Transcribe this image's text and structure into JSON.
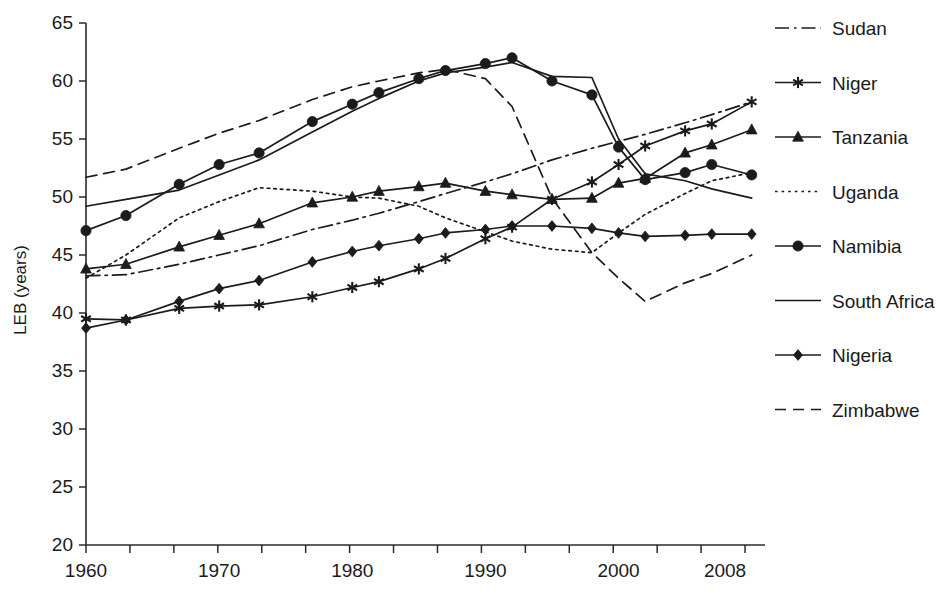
{
  "chart_data": {
    "type": "line",
    "title": "",
    "xlabel": "",
    "ylabel": "LEB (years)",
    "xlim": [
      1960,
      2011
    ],
    "ylim": [
      20,
      65
    ],
    "grid": false,
    "legend_position": "right",
    "x_tick_labels": [
      "1960",
      "1970",
      "1980",
      "1990",
      "2000",
      "2008"
    ],
    "x_tick_values": [
      1960,
      1970,
      1980,
      1990,
      2000,
      2008
    ],
    "x_minor_tick_step": 3.3,
    "y_tick_labels": [
      "20",
      "25",
      "30",
      "35",
      "40",
      "45",
      "50",
      "55",
      "60",
      "65"
    ],
    "y_tick_values": [
      20,
      25,
      30,
      35,
      40,
      45,
      50,
      55,
      60,
      65
    ],
    "x": [
      1960,
      1963,
      1967,
      1970,
      1973,
      1977,
      1980,
      1982,
      1985,
      1987,
      1990,
      1992,
      1995,
      1998,
      2000,
      2002,
      2005,
      2007,
      2010
    ],
    "series": [
      {
        "name": "Sudan",
        "style": "dashdot",
        "marker": "none",
        "values": [
          43.2,
          43.3,
          44.2,
          45.0,
          45.8,
          47.2,
          48.0,
          48.6,
          49.6,
          50.3,
          51.3,
          52.0,
          53.2,
          54.2,
          54.8,
          55.4,
          56.4,
          57.1,
          58.2
        ]
      },
      {
        "name": "Niger",
        "style": "solid",
        "marker": "star",
        "values": [
          39.5,
          39.4,
          40.4,
          40.6,
          40.7,
          41.4,
          42.2,
          42.7,
          43.8,
          44.7,
          46.4,
          47.4,
          49.8,
          51.3,
          52.8,
          54.4,
          55.7,
          56.3,
          58.2
        ]
      },
      {
        "name": "Tanzania",
        "style": "solid",
        "marker": "triangle",
        "values": [
          43.8,
          44.2,
          45.7,
          46.7,
          47.7,
          49.5,
          50.0,
          50.5,
          50.9,
          51.2,
          50.5,
          50.2,
          49.8,
          49.9,
          51.2,
          51.6,
          53.8,
          54.5,
          55.8
        ]
      },
      {
        "name": "Uganda",
        "style": "dotted",
        "marker": "none",
        "values": [
          43.0,
          45.0,
          48.2,
          49.6,
          50.8,
          50.5,
          50.0,
          49.9,
          49.2,
          48.2,
          47.0,
          46.2,
          45.5,
          45.2,
          46.9,
          48.5,
          50.3,
          51.4,
          52.1
        ]
      },
      {
        "name": "Namibia",
        "style": "solid",
        "marker": "circle",
        "values": [
          47.1,
          48.4,
          51.1,
          52.8,
          53.8,
          56.5,
          58.0,
          59.0,
          60.2,
          60.9,
          61.5,
          62.0,
          60.0,
          58.8,
          54.3,
          51.5,
          52.1,
          52.8,
          51.9
        ]
      },
      {
        "name": "South Africa",
        "style": "solid",
        "marker": "none",
        "values": [
          49.2,
          49.8,
          50.6,
          51.9,
          53.2,
          55.6,
          57.4,
          58.5,
          60.0,
          60.7,
          61.2,
          61.6,
          60.4,
          60.3,
          55.0,
          52.0,
          51.4,
          50.7,
          49.9
        ]
      },
      {
        "name": "Nigeria",
        "style": "solid",
        "marker": "diamond",
        "values": [
          38.7,
          39.4,
          41.0,
          42.1,
          42.8,
          44.4,
          45.3,
          45.8,
          46.4,
          46.9,
          47.2,
          47.5,
          47.5,
          47.3,
          46.9,
          46.6,
          46.7,
          46.8,
          46.8
        ]
      },
      {
        "name": "Zimbabwe",
        "style": "dashed",
        "marker": "none",
        "values": [
          51.7,
          52.4,
          54.2,
          55.5,
          56.6,
          58.4,
          59.5,
          60.0,
          60.7,
          61.0,
          60.2,
          57.8,
          49.9,
          45.2,
          43.0,
          41.0,
          42.6,
          43.4,
          45.0
        ]
      }
    ]
  },
  "legend": {
    "items": [
      {
        "label": "Sudan"
      },
      {
        "label": "Niger"
      },
      {
        "label": "Tanzania"
      },
      {
        "label": "Uganda"
      },
      {
        "label": "Namibia"
      },
      {
        "label": "South Africa"
      },
      {
        "label": "Nigeria"
      },
      {
        "label": "Zimbabwe"
      }
    ]
  },
  "colors": {
    "ink": "#1b1b1b",
    "axis": "#2a2a2a",
    "background": "#ffffff"
  }
}
